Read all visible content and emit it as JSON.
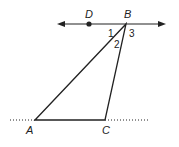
{
  "diagram": {
    "type": "geometry",
    "points": {
      "A": {
        "label": "A",
        "x": 35,
        "y": 120
      },
      "B": {
        "label": "B",
        "x": 126,
        "y": 24
      },
      "C": {
        "label": "C",
        "x": 105,
        "y": 120
      },
      "D": {
        "label": "D",
        "x": 89,
        "y": 24
      }
    },
    "angles": [
      {
        "label": "1",
        "at": "B",
        "between": "line DB and segment BA"
      },
      {
        "label": "2",
        "at": "B",
        "between": "segment BA and segment BC"
      },
      {
        "label": "3",
        "at": "B",
        "between": "segment BC and line (right ray)"
      }
    ],
    "lines": [
      {
        "name": "line-through-B",
        "style": "solid",
        "arrows": "both",
        "through": [
          "D",
          "B"
        ]
      },
      {
        "name": "line-through-AC",
        "style": "dotted",
        "through": [
          "A",
          "C"
        ]
      }
    ],
    "triangle": [
      "A",
      "B",
      "C"
    ],
    "colors": {
      "stroke": "#222222",
      "background": "#ffffff"
    }
  }
}
